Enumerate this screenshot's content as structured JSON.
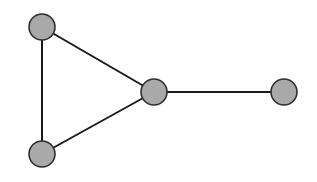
{
  "diagram": {
    "type": "graph",
    "directed": false,
    "canvas": {
      "width": 317,
      "height": 182,
      "background": "#ffffff"
    },
    "style": {
      "node_fill": "#a9a9a9",
      "node_stroke": "#2e2e2e",
      "node_radius": 13,
      "edge_color": "#1a1a1a"
    },
    "nodes": [
      {
        "id": "n1",
        "x": 42,
        "y": 27
      },
      {
        "id": "n2",
        "x": 42,
        "y": 154
      },
      {
        "id": "n3",
        "x": 154,
        "y": 92
      },
      {
        "id": "n4",
        "x": 284,
        "y": 92
      }
    ],
    "edges": [
      {
        "from": "n1",
        "to": "n2"
      },
      {
        "from": "n1",
        "to": "n3"
      },
      {
        "from": "n2",
        "to": "n3"
      },
      {
        "from": "n3",
        "to": "n4"
      }
    ]
  }
}
